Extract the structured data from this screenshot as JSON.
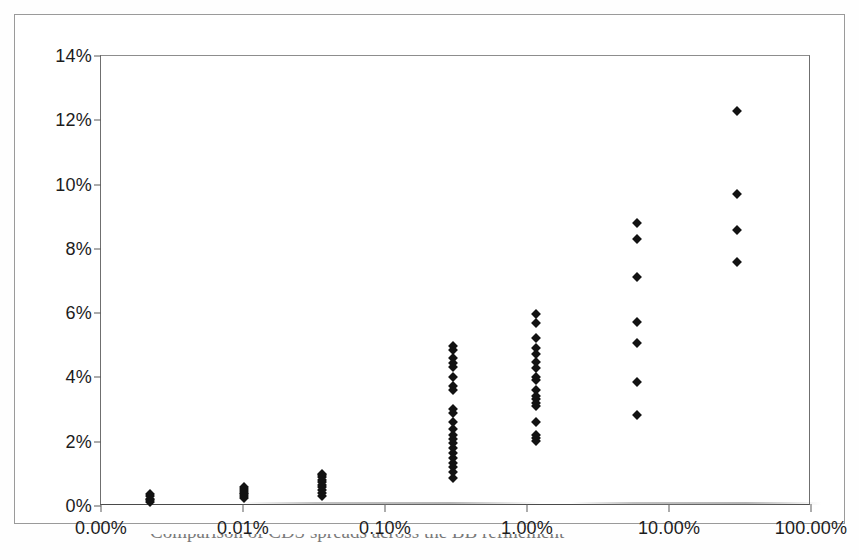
{
  "figure": {
    "caption": "Comparison of CDS spreads across the BB refinement"
  },
  "chart_data": {
    "type": "scatter",
    "title": "",
    "subtitle": "",
    "xlabel": "",
    "ylabel": "",
    "grid": false,
    "legend": false,
    "legend_position": "none",
    "x_scale": "log",
    "y_scale": "linear",
    "xlim": [
      0.001,
      100
    ],
    "ylim": [
      0,
      14
    ],
    "x_tick_labels": [
      "0.00%",
      "0.01%",
      "0.10%",
      "1.00%",
      "10.00%",
      "100.00%"
    ],
    "x_tick_values": [
      0.001,
      0.01,
      0.1,
      1,
      10,
      100
    ],
    "y_tick_labels": [
      "0%",
      "2%",
      "4%",
      "6%",
      "8%",
      "10%",
      "12%",
      "14%"
    ],
    "y_tick_values": [
      0,
      2,
      4,
      6,
      8,
      10,
      12,
      14
    ],
    "marker": "diamond",
    "marker_color": "#121212",
    "point_count": 70,
    "clusters": [
      {
        "name": "cluster-0.002",
        "x": 0.0022,
        "y_values": [
          0.12,
          0.18,
          0.22,
          0.3,
          0.38
        ]
      },
      {
        "name": "cluster-0.010",
        "x": 0.0102,
        "y_values": [
          0.25,
          0.32,
          0.38,
          0.42,
          0.46,
          0.52,
          0.58
        ]
      },
      {
        "name": "cluster-0.035",
        "x": 0.036,
        "y_values": [
          0.3,
          0.4,
          0.5,
          0.58,
          0.66,
          0.74,
          0.82,
          0.9,
          0.96,
          1.0
        ]
      },
      {
        "name": "cluster-0.300",
        "x": 0.3,
        "y_values": [
          0.88,
          1.05,
          1.2,
          1.35,
          1.5,
          1.65,
          1.8,
          1.95,
          2.1,
          2.22,
          2.4,
          2.62,
          2.88,
          3.02,
          3.6,
          3.72,
          4.02,
          4.32,
          4.44,
          4.62,
          4.84,
          4.98
        ]
      },
      {
        "name": "cluster-1.100",
        "x": 1.15,
        "y_values": [
          2.02,
          2.12,
          2.22,
          2.62,
          3.12,
          3.22,
          3.32,
          3.42,
          3.62,
          3.92,
          4.02,
          4.3,
          4.48,
          4.72,
          4.92,
          5.22,
          5.68,
          5.98
        ]
      },
      {
        "name": "cluster-6.000",
        "x": 6.0,
        "y_values": [
          2.82,
          3.86,
          5.06,
          5.72,
          7.14,
          8.32,
          8.8
        ]
      },
      {
        "name": "cluster-30.000",
        "x": 30.0,
        "y_values": [
          7.58,
          8.58,
          9.72,
          12.28
        ]
      }
    ]
  }
}
